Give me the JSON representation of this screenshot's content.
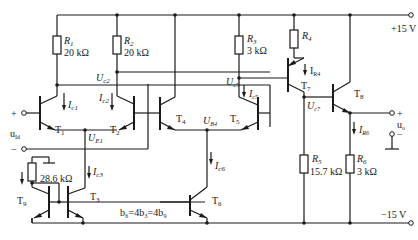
{
  "supplies": {
    "positive": "+15 V",
    "negative": "−15 V"
  },
  "resistors": {
    "R1": {
      "name": "R",
      "sub": "1",
      "value": "20 kΩ"
    },
    "R2": {
      "name": "R",
      "sub": "2",
      "value": "20 kΩ"
    },
    "R3": {
      "name": "R",
      "sub": "3",
      "value": "3 kΩ"
    },
    "R4": {
      "name": "R",
      "sub": "4",
      "value": ""
    },
    "R5": {
      "name": "R",
      "sub": "5",
      "value": "15.7 kΩ"
    },
    "R6": {
      "name": "R",
      "sub": "6",
      "value": "3 kΩ"
    },
    "Rref": {
      "value": "28.6 kΩ"
    }
  },
  "transistors": {
    "T1": {
      "name": "T",
      "sub": "1"
    },
    "T2": {
      "name": "T",
      "sub": "2"
    },
    "T3": {
      "name": "T",
      "sub": "3"
    },
    "T4": {
      "name": "T",
      "sub": "4"
    },
    "T5": {
      "name": "T",
      "sub": "5"
    },
    "T6": {
      "name": "T",
      "sub": "6"
    },
    "T7": {
      "name": "T",
      "sub": "7"
    },
    "T8": {
      "name": "T",
      "sub": "8"
    },
    "T9": {
      "name": "T",
      "sub": "9"
    }
  },
  "currents": {
    "Ic1": {
      "name": "I",
      "sub": "c1"
    },
    "Ic2": {
      "name": "I",
      "sub": "c2"
    },
    "Ic3": {
      "name": "I",
      "sub": "c3"
    },
    "Ic5": {
      "name": "I",
      "sub": "c5"
    },
    "Ic6": {
      "name": "I",
      "sub": "c6"
    },
    "IR4": {
      "name": "I",
      "sub": "R4"
    },
    "IR6": {
      "name": "I",
      "sub": "R6"
    }
  },
  "voltages": {
    "Uc2": {
      "name": "U",
      "sub": "c2"
    },
    "Uc5": {
      "name": "U",
      "sub": "c5"
    },
    "Uc7": {
      "name": "U",
      "sub": "c7"
    },
    "UE1": {
      "name": "U",
      "sub": "E1"
    },
    "UB4": {
      "name": "U",
      "sub": "B4"
    }
  },
  "ports": {
    "input": {
      "name": "u",
      "sub": "Id",
      "plus": "+",
      "minus": "−"
    },
    "output": {
      "name": "u",
      "sub": "o",
      "plus": "+",
      "minus": "−"
    }
  },
  "note": "b₆=4b₃=4b₉"
}
